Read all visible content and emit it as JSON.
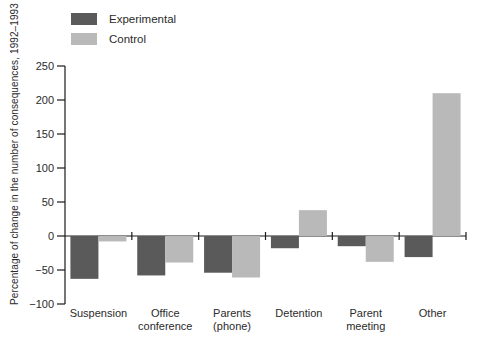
{
  "chart_data": {
    "type": "bar",
    "title": "",
    "xlabel": "",
    "ylabel": "Percentage of change in the number of consequences, 1992–1993",
    "ylim": [
      -100,
      250
    ],
    "ytick_values": [
      250,
      200,
      150,
      100,
      50,
      0,
      -50,
      -100
    ],
    "ytick_labels": [
      "250",
      "200",
      "150",
      "100",
      "50",
      "0",
      "−50",
      "−100"
    ],
    "grid": false,
    "legend_position": "top-left",
    "categories": [
      "Suspension",
      "Office conference",
      "Parents (phone)",
      "Detention",
      "Parent meeting",
      "Other"
    ],
    "category_label_lines": [
      [
        "Suspension"
      ],
      [
        "Office",
        "conference"
      ],
      [
        "Parents",
        "(phone)"
      ],
      [
        "Detention"
      ],
      [
        "Parent",
        "meeting"
      ],
      [
        "Other"
      ]
    ],
    "series": [
      {
        "name": "Experimental",
        "color": "#5a5a5a",
        "values": [
          -63,
          -58,
          -54,
          -18,
          -15,
          -31
        ]
      },
      {
        "name": "Control",
        "color": "#b9b9b9",
        "values": [
          -8,
          -39,
          -61,
          38,
          -38,
          210
        ]
      }
    ],
    "colors": {
      "axis": "#1a1a1a",
      "text": "#2b2b2b",
      "background": "#ffffff"
    }
  }
}
